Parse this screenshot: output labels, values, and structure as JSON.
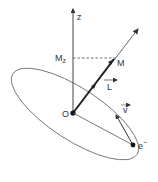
{
  "diagram": {
    "labels": {
      "z_axis": "z",
      "mz": "M",
      "mz_sub": "z",
      "m_vector": "M",
      "l_vector": "L",
      "origin": "O",
      "velocity": "v",
      "electron": "e",
      "electron_sup": "−"
    },
    "colors": {
      "line": "#333333",
      "thin_line": "#555555",
      "background": "#ffffff"
    }
  }
}
